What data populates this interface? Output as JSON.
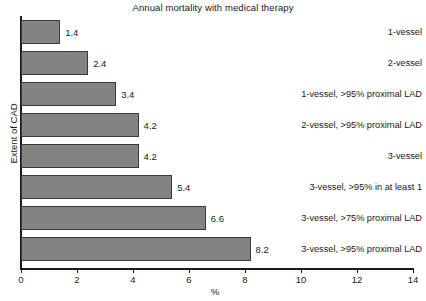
{
  "chart_data": {
    "type": "bar",
    "orientation": "horizontal",
    "title": "Annual mortality with medical therapy",
    "xlabel": "%",
    "ylabel": "Extent of CAD",
    "xlim": [
      0,
      14
    ],
    "xticks": [
      0,
      2,
      4,
      6,
      8,
      10,
      12,
      14
    ],
    "grid": false,
    "legend": null,
    "bar_color": "#838383",
    "bar_edge_color": "#3a3a3a",
    "categories": [
      "1-vessel",
      "2-vessel",
      "1-vessel, >95% proximal LAD",
      "2-vessel, >95% proximal LAD",
      "3-vessel",
      "3-vessel, >95% in at least 1",
      "3-vessel, >75% proximal LAD",
      "3-vessel, >95% proximal LAD"
    ],
    "values": [
      1.4,
      2.4,
      3.4,
      4.2,
      4.2,
      5.4,
      6.6,
      8.2
    ],
    "value_labels": [
      "1.4",
      "2.4",
      "3.4",
      "4.2",
      "4.2",
      "5.4",
      "6.6",
      "8.2"
    ]
  }
}
